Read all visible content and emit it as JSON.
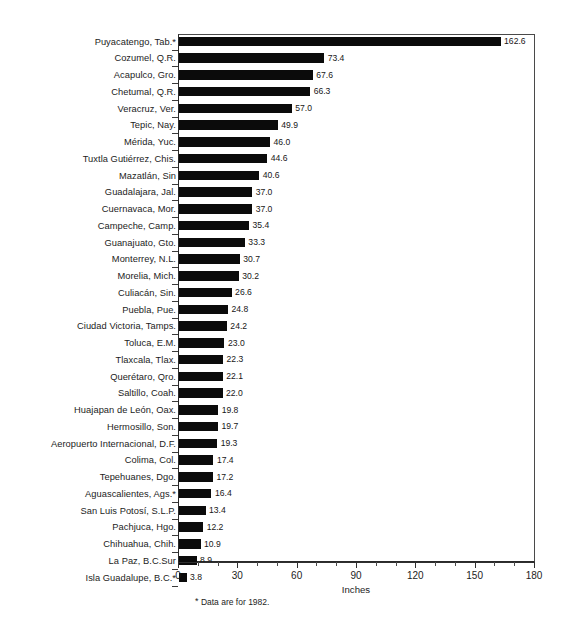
{
  "chart_data": {
    "type": "bar",
    "orientation": "horizontal",
    "title": "",
    "xlabel": "Inches",
    "ylabel": "",
    "xlim": [
      0,
      180
    ],
    "xticks": [
      0,
      30,
      60,
      90,
      120,
      150,
      180
    ],
    "xtick_labels": [
      "0",
      "30",
      "60",
      "90",
      "120",
      "150",
      "180"
    ],
    "minor_tick_interval": 10,
    "grid": false,
    "legend": null,
    "bar_color": "#0b0b0b",
    "value_label_format": "one-decimal",
    "footnote": "* Data are for 1982.",
    "footnote_marker": "*",
    "categories": [
      "Puyacatengo, Tab.*",
      "Cozumel, Q.R.",
      "Acapulco, Gro.",
      "Chetumal, Q.R.",
      "Veracruz, Ver.",
      "Tepic, Nay.",
      "Mérida, Yuc.",
      "Tuxtla Gutiérrez, Chis.",
      "Mazatlán, Sin",
      "Guadalajara, Jal.",
      "Cuernavaca, Mor.",
      "Campeche, Camp.",
      "Guanajuato, Gto.",
      "Monterrey, N.L.",
      "Morelia, Mich.",
      "Culiacán, Sin.",
      "Puebla, Pue.",
      "Ciudad Victoria, Tamps.",
      "Toluca, E.M.",
      "Tlaxcala, Tlax.",
      "Querétaro, Qro.",
      "Saltillo, Coah.",
      "Huajapan de León, Oax.",
      "Hermosillo, Son.",
      "Aeropuerto Internacional, D.F.",
      "Colima, Col.",
      "Tepehuanes, Dgo.",
      "Aguascalientes, Ags.*",
      "San Luis Potosí, S.L.P.",
      "Pachjuca, Hgo.",
      "Chihuahua, Chih.",
      "La Paz, B.C.Sur",
      "Isla Guadalupe, B.C.*"
    ],
    "values": [
      162.6,
      73.4,
      67.6,
      66.3,
      57.0,
      49.9,
      46.0,
      44.6,
      40.6,
      37.0,
      37.0,
      35.4,
      33.3,
      30.7,
      30.2,
      26.6,
      24.8,
      24.2,
      23.0,
      22.3,
      22.1,
      22.0,
      19.8,
      19.7,
      19.3,
      17.4,
      17.2,
      16.4,
      13.4,
      12.2,
      10.9,
      8.9,
      3.8
    ],
    "value_labels": [
      "162.6",
      "73.4",
      "67.6",
      "66.3",
      "57.0",
      "49.9",
      "46.0",
      "44.6",
      "40.6",
      "37.0",
      "37.0",
      "35.4",
      "33.3",
      "30.7",
      "30.2",
      "26.6",
      "24.8",
      "24.2",
      "23.0",
      "22.3",
      "22.1",
      "22.0",
      "19.8",
      "19.7",
      "19.3",
      "17.4",
      "17.2",
      "16.4",
      "13.4",
      "12.2",
      "10.9",
      "8.9",
      "3.8"
    ]
  }
}
